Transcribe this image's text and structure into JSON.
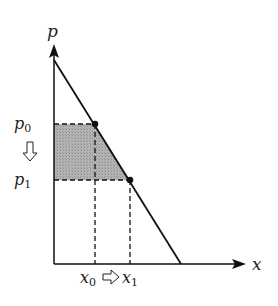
{
  "diagram": {
    "type": "demand-curve-price-change",
    "axes": {
      "y_label": "p",
      "x_label": "x"
    },
    "prices": [
      {
        "name": "p",
        "sub": "0"
      },
      {
        "name": "p",
        "sub": "1"
      }
    ],
    "quantities": [
      {
        "name": "x",
        "sub": "0"
      },
      {
        "name": "x",
        "sub": "1"
      }
    ],
    "arrows": {
      "price_change": "down",
      "quantity_change": "right"
    },
    "colors": {
      "line": "#111111",
      "shade": "#a9a9a9",
      "background": "#ffffff"
    }
  }
}
